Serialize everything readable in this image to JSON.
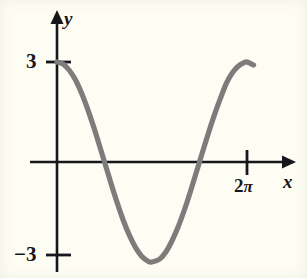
{
  "figure": {
    "background_color": "#fdfdf4",
    "axis_color": "#17161a",
    "curve_color": "#7d7c7a"
  },
  "labels": {
    "y_axis": "y",
    "x_axis": "x",
    "y_tick_positive": "3",
    "y_tick_negative": "−3",
    "x_tick_2pi_number": "2",
    "x_tick_2pi_symbol": "π"
  },
  "chart_data": {
    "type": "line",
    "title": "",
    "xlabel": "x",
    "ylabel": "y",
    "function": "y = 3 cos(x)",
    "amplitude": 3,
    "period": "2π",
    "xlim": [
      0,
      7.4
    ],
    "ylim": [
      -3.6,
      3.6
    ],
    "grid": false,
    "legend": false,
    "x_ticks": [
      {
        "value": 6.2832,
        "label": "2π"
      }
    ],
    "y_ticks": [
      {
        "value": 3,
        "label": "3"
      },
      {
        "value": -3,
        "label": "−3"
      }
    ],
    "axes_arrows": {
      "x_positive": true,
      "y_positive": true
    },
    "x": [
      0.0,
      0.2,
      0.4,
      0.6,
      0.8,
      1.0,
      1.2,
      1.4,
      1.5708,
      1.8,
      2.0,
      2.2,
      2.4,
      2.6,
      2.8,
      3.0,
      3.1416,
      3.4,
      3.6,
      3.8,
      4.0,
      4.2,
      4.4,
      4.6,
      4.7124,
      5.0,
      5.2,
      5.4,
      5.6,
      5.8,
      6.0,
      6.2,
      6.2832,
      6.5
    ],
    "y": [
      3.0,
      2.94,
      2.76,
      2.48,
      2.09,
      1.62,
      1.09,
      0.51,
      0.0,
      -0.68,
      -1.25,
      -1.77,
      -2.21,
      -2.57,
      -2.83,
      -2.97,
      -3.0,
      -2.91,
      -2.7,
      -2.37,
      -1.96,
      -1.47,
      -0.92,
      -0.33,
      0.0,
      0.85,
      1.4,
      1.9,
      2.36,
      2.68,
      2.88,
      2.99,
      3.0,
      2.91
    ],
    "zero_crossings": [
      "π/2",
      "3π/2"
    ],
    "minimum": {
      "x": "π",
      "y": -3
    },
    "maxima": [
      {
        "x": 0,
        "y": 3
      },
      {
        "x": "2π",
        "y": 3
      }
    ]
  }
}
